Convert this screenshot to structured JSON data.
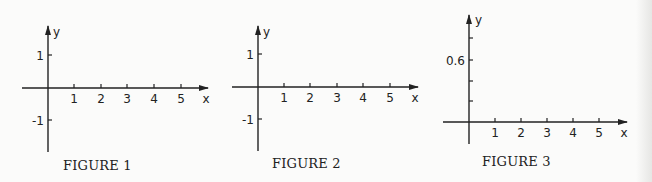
{
  "figures": [
    {
      "caption": "FIGURE 1",
      "x_label": "x",
      "y_label": "y",
      "x_ticks": [
        "1",
        "2",
        "3",
        "4",
        "5"
      ],
      "y_ticks": [
        "1",
        "-1"
      ]
    },
    {
      "caption": "FIGURE 2",
      "x_label": "x",
      "y_label": "y",
      "x_ticks": [
        "1",
        "2",
        "3",
        "4",
        "5"
      ],
      "y_ticks": [
        "1",
        "-1"
      ]
    },
    {
      "caption": "FIGURE 3",
      "x_label": "x",
      "y_label": "y",
      "x_ticks": [
        "1",
        "2",
        "3",
        "4",
        "5"
      ],
      "y_ticks": [
        "0.6"
      ]
    }
  ],
  "colors": {
    "ink": "#222222",
    "paper": "#fbfbfa"
  }
}
